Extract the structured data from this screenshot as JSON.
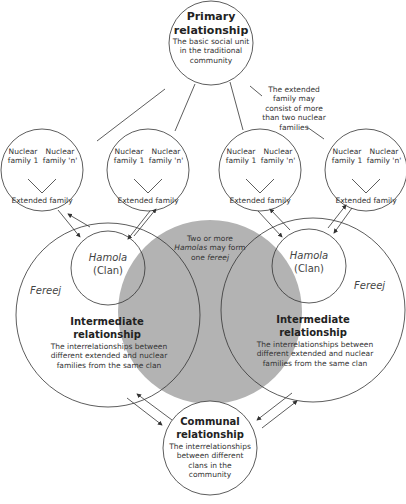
{
  "primary": {
    "title": "Primary relationship",
    "description": "The basic social unit in the traditional community"
  },
  "annotation_extended": "The extended family may consist of more than two nuclear families",
  "family_groups": [
    {
      "nuclear_1": "Nuclear family 1",
      "nuclear_n": "Nuclear family 'n'",
      "extended": "Extended family"
    },
    {
      "nuclear_1": "Nuclear family 1",
      "nuclear_n": "Nuclear family 'n'",
      "extended": "Extended family"
    },
    {
      "nuclear_1": "Nuclear family 1",
      "nuclear_n": "Nuclear family 'n'",
      "extended": "Extended family"
    },
    {
      "nuclear_1": "Nuclear family 1",
      "nuclear_n": "Nuclear family 'n'",
      "extended": "Extended family"
    }
  ],
  "fereej_left": {
    "clan_name": "Hamola",
    "clan_label": "(Clan)",
    "fereej": "Fereej",
    "title": "Intermediate relationship",
    "description": "The interrelationships between different extended and nuclear families from the same clan"
  },
  "fereej_right": {
    "clan_name": "Hamola",
    "clan_label": "(Clan)",
    "fereej": "Fereej",
    "title": "Intermediate relationship",
    "description": "The interrelationships between different extended and nuclear families from the same clan"
  },
  "overlap_note": {
    "line1": "Two or more",
    "line2_italic": "Hamolas",
    "line2_rest": " may form",
    "line3_rest": "one ",
    "line3_italic": "fereej"
  },
  "communal": {
    "title": "Communal relationship",
    "description": "The interrelationships between different clans in the community"
  },
  "colors": {
    "overlap_fill": "#b3b3b3",
    "stroke": "#333333"
  }
}
